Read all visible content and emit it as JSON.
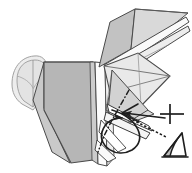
{
  "figure": {
    "type": "origami-instruction-illustration",
    "caption": "",
    "background_color": "#ffffff",
    "canvas": {
      "width": 192,
      "height": 173
    }
  },
  "palette": {
    "outline": "#3a3a3a",
    "outline_soft": "#6e6e6e",
    "paper_front_dark": "#b3b3b3",
    "paper_front_mid": "#c4c4c4",
    "paper_back_light": "#e8e8e8",
    "paper_highlight": "#f2f2f2",
    "paper_shadow": "#9d9d9d",
    "ghost_outline": "#9b9b9b",
    "ghost_fill": "#ededed",
    "symbol_stroke": "#1f1f1f",
    "white": "#ffffff"
  },
  "shapes": {
    "body_main": {
      "label": "main body panel",
      "fill": "#b3b3b3",
      "points": "41,62 95,62 95,160 66,160 41,108"
    },
    "body_left_flap": {
      "label": "left lower flap",
      "fill": "#c4c4c4",
      "points": "28,96 41,62 41,108 66,160 50,150"
    },
    "ghost_head": {
      "label": "ghosted rounded head outline",
      "fill": "#ededed",
      "stroke": "#9b9b9b",
      "points": "13,84 16,70 25,61 37,58 44,62 44,92 32,106 22,102"
    },
    "right_wing": {
      "label": "right wing panel",
      "fill": "#e8e8e8",
      "points": "100,68 137,52 168,75 140,105 110,92"
    },
    "right_wing_lower": {
      "label": "right lower wing panel",
      "fill": "#dedede",
      "points": "110,92 140,105 152,112 128,122 104,108"
    },
    "upper_spike_a": {
      "label": "upper pointed flap A",
      "fill": "#c9c9c9",
      "points": "98,66 110,20 138,8 186,14 132,50"
    },
    "upper_spike_b": {
      "label": "upper pointed flap B",
      "fill": "#e2e2e2",
      "points": "104,64 140,22 188,12 138,54"
    },
    "center_column": {
      "label": "center white column",
      "fill": "#fbfbfb",
      "points": "95,62 104,62 106,160 96,166"
    },
    "center_column_shadow": {
      "label": "center column shadow strip",
      "fill": "#cfcfcf",
      "points": "92,62 96,62 97,164 93,160"
    },
    "mid_triangle": {
      "label": "middle triangular panel",
      "fill": "#d6d6d6",
      "points": "104,70 146,108 118,124 104,112"
    }
  },
  "fold_lines": [
    {
      "name": "dash-dot-fold-line",
      "style": "dash-dot",
      "d": "M127,92 L118,107 L110,120 L102,135 L96,150"
    },
    {
      "name": "crease-line-wing",
      "style": "solid-thin",
      "d": "M100,68 L168,75"
    },
    {
      "name": "crease-line-wing-2",
      "style": "solid-thin",
      "d": "M110,92 L168,75"
    },
    {
      "name": "crease-line-body-top",
      "style": "solid-thin",
      "d": "M41,62 L95,62"
    },
    {
      "name": "crease-line-ghost",
      "style": "solid-thin",
      "d": "M28,63 L30,104"
    }
  ],
  "symbols": {
    "loop_arrow": {
      "name": "fold-and-unfold-loop-arrow",
      "description": "large looping arrow indicating a roll / curl fold"
    },
    "push_arrow": {
      "name": "push-in-arrow",
      "description": "solid arrow pointing left into the model"
    },
    "plus_sign": {
      "name": "plus-sign",
      "label": "+",
      "description": "plus symbol marking a combined operation"
    },
    "detail_connector": {
      "name": "dotted-detail-connector",
      "description": "dotted leader line linking the model to the enlarged detail"
    },
    "detail_inset": {
      "name": "detail-inset-triangle",
      "description": "small enlarged triangular detail view of the resulting fold"
    }
  }
}
